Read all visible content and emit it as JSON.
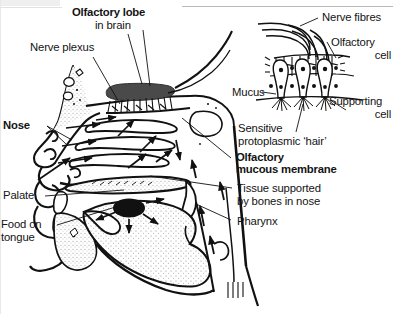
{
  "figure": {
    "type": "anatomical-diagram",
    "width": 393,
    "height": 314,
    "background_color": "#ffffff",
    "ink_color": "#111111",
    "bulb_fill_color": "#4a4a4a",
    "bolus_fill_color": "#111111",
    "stipple_color": "#9a9a9a"
  },
  "labels": {
    "olfactory_lobe": "Olfactory lobe",
    "in_brain": "in brain",
    "nerve_plexus": "Nerve plexus",
    "nose": "Nose",
    "palate": "Palate",
    "food_on": "Food on",
    "tongue": "tongue",
    "olfactory_mucous_1": "Olfactory",
    "olfactory_mucous_2": "mucous membrane",
    "tissue_supported_1": "Tissue supported",
    "tissue_supported_2": "by bones in nose",
    "pharynx": "Pharynx",
    "nerve_fibres": "Nerve fibres",
    "olfactory_cell_1": "Olfactory",
    "olfactory_cell_2": "cell",
    "mucus": "Mucus",
    "supporting_cell_1": "Supporting",
    "supporting_cell_2": "cell",
    "sensitive_hair_1": "Sensitive",
    "sensitive_hair_2": "protoplasmic ‘hair’"
  },
  "label_styles": {
    "olfactory_lobe": "bold",
    "in_brain": "regular",
    "nerve_plexus": "regular",
    "nose": "bold",
    "palate": "regular",
    "food_on": "regular",
    "tongue": "regular",
    "olfactory_mucous_1": "bold",
    "olfactory_mucous_2": "bold",
    "tissue_supported_1": "regular",
    "tissue_supported_2": "regular",
    "pharynx": "regular",
    "nerve_fibres": "regular",
    "olfactory_cell_1": "regular",
    "olfactory_cell_2": "regular",
    "mucus": "regular",
    "supporting_cell_1": "regular",
    "supporting_cell_2": "regular",
    "sensitive_hair_1": "regular",
    "sensitive_hair_2": "regular"
  },
  "structures": {
    "head_profile": "sagittal-head-outline",
    "olfactory_bulb": "dark-grey-elongated-lobe",
    "olfactory_nerve_fibres": "bundle-crossing-cribriform-plate",
    "turbinates": "three-scroll-shaped-nasal-conchae",
    "hard_palate": "palate-band",
    "tongue": "stippled-tongue-body",
    "food_bolus": "black-oval-on-tongue",
    "pharynx_passage": "vertical-throat-channel",
    "airflow_arrows": "arrows-showing-inhaled-air-and-odour-path"
  },
  "inset": {
    "name": "olfactory-epithelium-detail",
    "cells": 3,
    "nerve_fibre_strands": 3,
    "nuclei_rows": 2,
    "hair_tufts": 3
  }
}
